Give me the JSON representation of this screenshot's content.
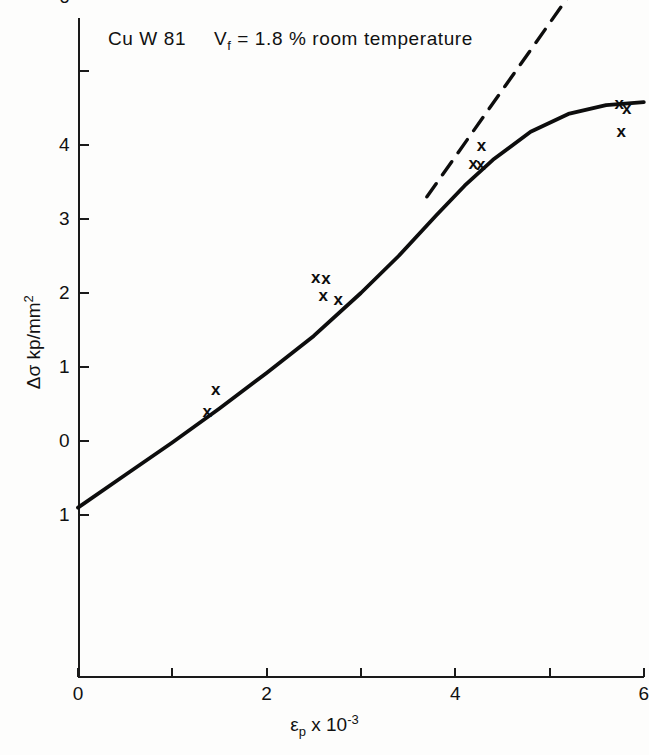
{
  "chart_data": {
    "type": "scatter",
    "title_parts": {
      "material": "Cu W 81",
      "volume_fraction_symbol": "V",
      "volume_fraction_sub": "f",
      "volume_fraction_value": "= 1.8 %",
      "condition": "room temperature"
    },
    "xlabel": "εp x 10-3",
    "xlabel_parts": {
      "symbol": "ε",
      "sub": "p",
      "times": "x 10",
      "exp": "-3"
    },
    "ylabel": "Δσ kp/mm2",
    "ylabel_parts": {
      "symbol": "Δσ",
      "unit": "kp/mm",
      "exp": "2"
    },
    "xlim": [
      0,
      6
    ],
    "ylim": [
      -1,
      6.4
    ],
    "xticks": [
      0,
      1,
      2,
      3,
      4,
      5,
      6
    ],
    "xtick_labels": [
      "0",
      "",
      "2",
      "",
      "4",
      "",
      "6"
    ],
    "yticks": [
      -1,
      0,
      1,
      2,
      3,
      4,
      5,
      6
    ],
    "ytick_labels": [
      "1",
      "0",
      "1",
      "2",
      "3",
      "4",
      "",
      "6"
    ],
    "grid": false,
    "legend": "none",
    "marker_symbol": "x",
    "series": [
      {
        "name": "measured points",
        "marker": "x",
        "points": [
          {
            "x": 1.46,
            "y": 0.7
          },
          {
            "x": 1.37,
            "y": 0.41
          },
          {
            "x": 2.52,
            "y": 2.22
          },
          {
            "x": 2.63,
            "y": 2.2
          },
          {
            "x": 2.6,
            "y": 1.97
          },
          {
            "x": 2.76,
            "y": 1.92
          },
          {
            "x": 4.28,
            "y": 4.0
          },
          {
            "x": 4.19,
            "y": 3.76
          },
          {
            "x": 4.27,
            "y": 3.74
          },
          {
            "x": 5.74,
            "y": 4.57
          },
          {
            "x": 5.82,
            "y": 4.5
          },
          {
            "x": 5.76,
            "y": 4.19
          }
        ]
      }
    ],
    "curves": [
      {
        "name": "fitted-solid-curve",
        "style": "solid",
        "points": [
          {
            "x": 0.0,
            "y": -0.9
          },
          {
            "x": 0.5,
            "y": -0.46
          },
          {
            "x": 1.0,
            "y": -0.02
          },
          {
            "x": 1.5,
            "y": 0.44
          },
          {
            "x": 2.0,
            "y": 0.92
          },
          {
            "x": 2.5,
            "y": 1.42
          },
          {
            "x": 3.0,
            "y": 2.0
          },
          {
            "x": 3.4,
            "y": 2.5
          },
          {
            "x": 3.8,
            "y": 3.05
          },
          {
            "x": 4.1,
            "y": 3.45
          },
          {
            "x": 4.4,
            "y": 3.8
          },
          {
            "x": 4.8,
            "y": 4.18
          },
          {
            "x": 5.2,
            "y": 4.42
          },
          {
            "x": 5.6,
            "y": 4.54
          },
          {
            "x": 6.0,
            "y": 4.58
          }
        ]
      },
      {
        "name": "extrapolated-dashed-line",
        "style": "dashed",
        "points": [
          {
            "x": 3.7,
            "y": 3.3
          },
          {
            "x": 5.28,
            "y": 6.15
          }
        ]
      }
    ]
  },
  "axes_geometry": {
    "x0_px": 78,
    "x_unit_px": 94.3,
    "y0_px": 441,
    "y_unit_px": 74.0
  }
}
